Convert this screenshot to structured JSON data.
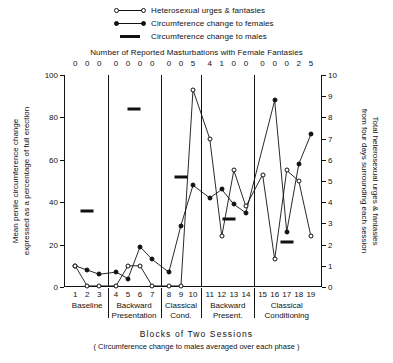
{
  "legend": {
    "items": [
      {
        "label": "Heterosexual urges & fantasies",
        "marker": "open-circle-line"
      },
      {
        "label": "Circumference change to females",
        "marker": "filled-circle-line"
      },
      {
        "label": "Circumference change to males",
        "marker": "thick-dash"
      }
    ]
  },
  "top_axis": {
    "title": "Number of Reported Masturbations with Female Fantasies",
    "values": [
      "0",
      "0",
      "0",
      "0",
      "0",
      "0",
      "0",
      "0",
      "0",
      "5",
      "4",
      "1",
      "0",
      "0",
      "0",
      "0",
      "0",
      "2",
      "5"
    ]
  },
  "axes": {
    "left_title": "Mean penile circumference change expressed as a percentage of full erection",
    "left_ticks": [
      "0",
      "20",
      "40",
      "60",
      "80",
      "100"
    ],
    "left_range": [
      0,
      100
    ],
    "right_title": "Total heterosexual urges & fantasies from four days surrounding each session",
    "right_ticks": [
      "0",
      "1",
      "2",
      "3",
      "4",
      "5",
      "6",
      "7",
      "8",
      "9",
      "10"
    ],
    "right_range": [
      0,
      10
    ],
    "x_title": "Blocks of Two Sessions",
    "x_subtitle": "( Circumference change to males averaged over each phase )",
    "x_ticks": [
      "1",
      "2",
      "3",
      "4",
      "5",
      "6",
      "7",
      "8",
      "9",
      "10",
      "11",
      "12",
      "13",
      "14",
      "15",
      "16",
      "17",
      "18",
      "19"
    ]
  },
  "phases": [
    {
      "name": "Baseline",
      "line2": "",
      "sessions": [
        1,
        3
      ]
    },
    {
      "name": "Backward",
      "line2": "Presentation",
      "sessions": [
        4,
        7
      ]
    },
    {
      "name": "Classical",
      "line2": "Cond.",
      "sessions": [
        8,
        10
      ]
    },
    {
      "name": "Backward",
      "line2": "Present.",
      "sessions": [
        11,
        14
      ]
    },
    {
      "name": "Classical",
      "line2": "Conditioning",
      "sessions": [
        15,
        19
      ]
    }
  ],
  "chart_data": {
    "type": "line",
    "title": "",
    "xlabel": "Blocks of Two Sessions",
    "ylabel": "Mean penile circumference change expressed as a percentage of full erection",
    "ylabel_right": "Total heterosexual urges & fantasies from four days surrounding each session",
    "xlim": [
      1,
      19
    ],
    "ylim": [
      0,
      100
    ],
    "ylim_right": [
      0,
      10
    ],
    "grid": false,
    "legend_position": "top-center",
    "x": [
      1,
      2,
      3,
      4,
      5,
      6,
      7,
      8,
      9,
      10,
      11,
      12,
      13,
      14,
      15,
      16,
      17,
      18,
      19
    ],
    "series": [
      {
        "name": "Circumference change to females",
        "axis": "left",
        "marker": "filled-circle",
        "values": [
          10,
          8,
          6,
          7,
          4,
          19,
          13,
          7,
          29,
          48,
          42,
          46,
          39,
          35,
          null,
          88,
          26,
          58,
          72
        ]
      },
      {
        "name": "Heterosexual urges & fantasies",
        "axis": "right",
        "marker": "open-circle",
        "values": [
          1.0,
          0.05,
          0.05,
          0.05,
          1.0,
          1.0,
          0.05,
          0.05,
          0.05,
          9.3,
          7.0,
          2.4,
          5.5,
          3.8,
          5.3,
          1.3,
          5.5,
          5.0,
          2.4
        ]
      },
      {
        "name": "Circumference change to males",
        "axis": "left",
        "marker": "thick-dash",
        "phase_means": [
          {
            "phase": "Baseline",
            "x": 2.0,
            "value": 36
          },
          {
            "phase": "Backward Presentation",
            "x": 5.5,
            "value": 84
          },
          {
            "phase": "Classical Cond.",
            "x": 9.0,
            "value": 52
          },
          {
            "phase": "Backward Present.",
            "x": 12.6,
            "value": 32
          },
          {
            "phase": "Classical Conditioning",
            "x": 17.0,
            "value": 21
          }
        ]
      }
    ]
  }
}
